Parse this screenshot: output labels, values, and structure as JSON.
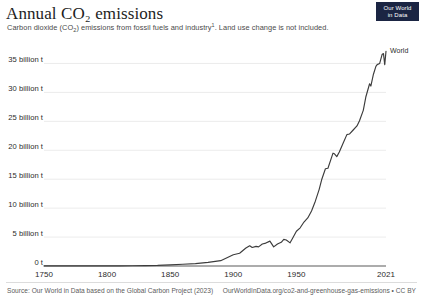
{
  "header": {
    "title": "Annual CO₂ emissions",
    "subtitle_before": "Carbon dioxide (CO",
    "subtitle_sub": "2",
    "subtitle_mid": ") emissions from fossil fuels and industry",
    "subtitle_sup": "1",
    "subtitle_after": ". Land use change is not included.",
    "subtitle_full": "Carbon dioxide (CO₂) emissions from fossil fuels and industry¹. Land use change is not included."
  },
  "logo": {
    "line1": "Our World",
    "line2": "in Data",
    "background": "#1b2543",
    "text_color": "#ffffff"
  },
  "footer": {
    "source": "Source: Our World in Data based on the Global Carbon Project (2023)",
    "license": "OurWorldInData.org/co2-and-greenhouse-gas-emissions • CC BY"
  },
  "chart_data": {
    "type": "line",
    "title": "Annual CO₂ emissions",
    "subtitle": "Carbon dioxide (CO₂) emissions from fossil fuels and industry¹. Land use change is not included.",
    "xlabel": "",
    "ylabel": "",
    "xlim": [
      1750,
      2021
    ],
    "ylim": [
      0,
      37500000000
    ],
    "grid": "horizontal",
    "legend_position": "line-end-label",
    "line_color": "#3c3c3c",
    "grid_color": "#e3e3e3",
    "axis_color": "#5b5b5b",
    "y_ticks": [
      {
        "value": 0,
        "label": "0 t"
      },
      {
        "value": 5000000000,
        "label": "5 billion t"
      },
      {
        "value": 10000000000,
        "label": "10 billion t"
      },
      {
        "value": 15000000000,
        "label": "15 billion t"
      },
      {
        "value": 20000000000,
        "label": "20 billion t"
      },
      {
        "value": 25000000000,
        "label": "25 billion t"
      },
      {
        "value": 30000000000,
        "label": "30 billion t"
      },
      {
        "value": 35000000000,
        "label": "35 billion t"
      }
    ],
    "x_ticks": [
      {
        "value": 1750,
        "label": "1750"
      },
      {
        "value": 1800,
        "label": "1800"
      },
      {
        "value": 1850,
        "label": "1850"
      },
      {
        "value": 1900,
        "label": "1900"
      },
      {
        "value": 1950,
        "label": "1950"
      },
      {
        "value": 2021,
        "label": "2021"
      }
    ],
    "series": [
      {
        "name": "World",
        "label": "World",
        "color": "#3c3c3c",
        "unit": "billion tonnes CO2",
        "x": [
          1750,
          1760,
          1770,
          1780,
          1790,
          1800,
          1810,
          1820,
          1830,
          1840,
          1850,
          1860,
          1870,
          1880,
          1890,
          1900,
          1905,
          1910,
          1913,
          1915,
          1918,
          1920,
          1923,
          1925,
          1929,
          1932,
          1935,
          1938,
          1940,
          1942,
          1945,
          1947,
          1950,
          1953,
          1956,
          1959,
          1962,
          1965,
          1968,
          1970,
          1973,
          1975,
          1979,
          1980,
          1982,
          1984,
          1987,
          1990,
          1992,
          1995,
          1998,
          2000,
          2003,
          2005,
          2008,
          2009,
          2011,
          2013,
          2014,
          2016,
          2018,
          2019,
          2020,
          2021
        ],
        "values": [
          0.01,
          0.01,
          0.01,
          0.01,
          0.02,
          0.03,
          0.03,
          0.05,
          0.07,
          0.11,
          0.2,
          0.3,
          0.42,
          0.62,
          0.92,
          1.95,
          2.2,
          3.1,
          3.5,
          3.2,
          3.4,
          3.3,
          3.8,
          3.9,
          4.3,
          3.3,
          3.8,
          4.1,
          4.6,
          4.5,
          4.0,
          4.8,
          6.0,
          6.6,
          7.6,
          8.3,
          9.5,
          11.2,
          13.2,
          14.9,
          16.8,
          16.9,
          19.5,
          19.4,
          18.9,
          19.7,
          21.2,
          22.7,
          22.8,
          23.5,
          24.2,
          25.1,
          26.9,
          29.2,
          31.5,
          31.1,
          33.1,
          34.5,
          34.8,
          35.0,
          36.6,
          36.7,
          34.8,
          37.1
        ]
      }
    ],
    "annotations": [
      {
        "text": "World",
        "x": 2021,
        "note": "series end label"
      }
    ]
  }
}
